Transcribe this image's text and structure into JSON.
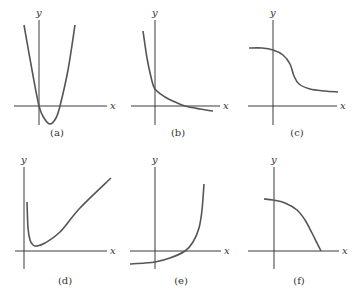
{
  "chart_data": [
    {
      "type": "line",
      "panel": "a",
      "label": "(a)",
      "xlabel": "x",
      "ylabel": "y",
      "description": "Upward-opening parabola passing through origin, minimum below x-axis to the right of y-axis",
      "points": [
        [
          24,
          25
        ],
        [
          32,
          70
        ],
        [
          39,
          106
        ],
        [
          44,
          118
        ],
        [
          50,
          124
        ],
        [
          56,
          118
        ],
        [
          60,
          106
        ],
        [
          68,
          70
        ],
        [
          75,
          25
        ]
      ]
    },
    {
      "type": "line",
      "panel": "b",
      "label": "(b)",
      "xlabel": "x",
      "ylabel": "y",
      "description": "Decreasing convex curve, steep on left, crossing y-axis above origin and crossing x-axis to the right, leveling slightly below x-axis",
      "points": [
        [
          143,
          31
        ],
        [
          147,
          58
        ],
        [
          151,
          77
        ],
        [
          155,
          89
        ],
        [
          165,
          97
        ],
        [
          175,
          102
        ],
        [
          185,
          106
        ],
        [
          200,
          109
        ],
        [
          213,
          111
        ]
      ]
    },
    {
      "type": "line",
      "panel": "c",
      "label": "(c)",
      "xlabel": "x",
      "ylabel": "y",
      "description": "Decreasing sigmoid-like curve, high plateau on left dropping to lower plateau above x-axis on right",
      "points": [
        [
          249,
          48
        ],
        [
          262,
          48
        ],
        [
          273,
          50
        ],
        [
          283,
          55
        ],
        [
          290,
          64
        ],
        [
          294,
          76
        ],
        [
          299,
          84
        ],
        [
          310,
          89
        ],
        [
          325,
          91
        ],
        [
          338,
          92
        ]
      ]
    },
    {
      "type": "line",
      "panel": "d",
      "label": "(d)",
      "xlabel": "x",
      "ylabel": "y",
      "description": "Curve starting high near y-axis, dropping sharply to a minimum just above x-axis, then rising linearly",
      "points": [
        [
          27,
          202
        ],
        [
          28,
          228
        ],
        [
          30,
          240
        ],
        [
          33,
          245
        ],
        [
          37,
          246
        ],
        [
          45,
          243
        ],
        [
          60,
          232
        ],
        [
          80,
          208
        ],
        [
          111,
          178
        ]
      ]
    },
    {
      "type": "line",
      "panel": "e",
      "label": "(e)",
      "xlabel": "x",
      "ylabel": "y",
      "description": "Increasing convex curve starting below x-axis, crossing y-axis below origin, crossing x-axis and rising steeply",
      "points": [
        [
          130,
          264
        ],
        [
          145,
          263
        ],
        [
          155,
          262
        ],
        [
          170,
          258
        ],
        [
          185,
          251
        ],
        [
          193,
          242
        ],
        [
          199,
          228
        ],
        [
          202,
          210
        ],
        [
          204,
          184
        ]
      ]
    },
    {
      "type": "line",
      "panel": "f",
      "label": "(f)",
      "xlabel": "x",
      "ylabel": "y",
      "description": "Decreasing concave curve starting above x-axis near y-axis, falling increasingly steeply to meet x-axis",
      "points": [
        [
          264,
          199
        ],
        [
          273,
          200
        ],
        [
          285,
          203
        ],
        [
          297,
          210
        ],
        [
          305,
          220
        ],
        [
          312,
          233
        ],
        [
          317,
          243
        ],
        [
          321,
          251
        ]
      ]
    }
  ],
  "axes": {
    "x_label": "x",
    "y_label": "y"
  },
  "panels": [
    {
      "id": "a",
      "label": "(a)",
      "yaxis_x": 39,
      "xaxis_y": 106,
      "x_from": 14,
      "x_to": 107,
      "y_from": 20,
      "y_to": 125,
      "label_x": 57,
      "label_y": 136
    },
    {
      "id": "b",
      "label": "(b)",
      "yaxis_x": 155,
      "xaxis_y": 106,
      "x_from": 131,
      "x_to": 220,
      "y_from": 20,
      "y_to": 125,
      "label_x": 178,
      "label_y": 136
    },
    {
      "id": "c",
      "label": "(c)",
      "yaxis_x": 273,
      "xaxis_y": 106,
      "x_from": 248,
      "x_to": 337,
      "y_from": 20,
      "y_to": 125,
      "label_x": 297,
      "label_y": 136
    },
    {
      "id": "d",
      "label": "(d)",
      "yaxis_x": 24,
      "xaxis_y": 251,
      "x_from": 15,
      "x_to": 107,
      "y_from": 167,
      "y_to": 269,
      "label_x": 65,
      "label_y": 284
    },
    {
      "id": "e",
      "label": "(e)",
      "yaxis_x": 155,
      "xaxis_y": 251,
      "x_from": 130,
      "x_to": 221,
      "y_from": 167,
      "y_to": 269,
      "label_x": 181,
      "label_y": 284
    },
    {
      "id": "f",
      "label": "(f)",
      "yaxis_x": 274,
      "xaxis_y": 251,
      "x_from": 248,
      "x_to": 339,
      "y_from": 167,
      "y_to": 269,
      "label_x": 299,
      "label_y": 284
    }
  ],
  "colors": {
    "axis": "#3a3a3a",
    "curve": "#555555",
    "background": "#ffffff"
  }
}
